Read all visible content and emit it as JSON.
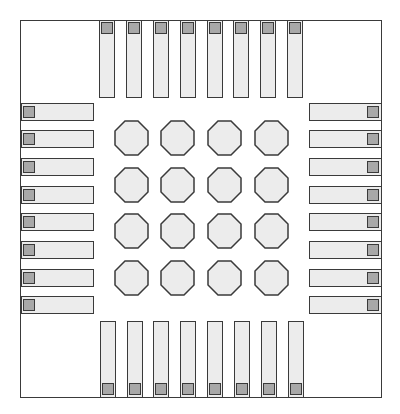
{
  "diagram": {
    "type": "QFN package footprint",
    "colors": {
      "outline": "#3a3a3a",
      "pad_fill": "#ececec",
      "pin_marker_fill": "#a8a8a8",
      "background": "#ffffff"
    },
    "pads_per_side": 8,
    "side_pads": {
      "top": {
        "x": [
          99,
          126,
          153,
          180,
          207,
          233,
          260,
          287
        ],
        "y": 20,
        "width": 16,
        "height": 78
      },
      "bottom": {
        "x": [
          100,
          127,
          153,
          180,
          207,
          234,
          261,
          288
        ],
        "y": 321,
        "width": 16,
        "height": 77
      },
      "left": {
        "y": [
          103,
          130,
          158,
          186,
          213,
          241,
          269,
          296
        ],
        "x": 21,
        "width": 73,
        "height": 18
      },
      "right": {
        "y": [
          103,
          130,
          158,
          186,
          213,
          241,
          269,
          296
        ],
        "x": 309,
        "width": 73,
        "height": 18
      }
    },
    "center_grid": {
      "shape": "octagon",
      "rows": 4,
      "cols": 4,
      "x": [
        114,
        160,
        207,
        254
      ],
      "y": [
        120,
        167,
        213,
        260
      ]
    }
  }
}
